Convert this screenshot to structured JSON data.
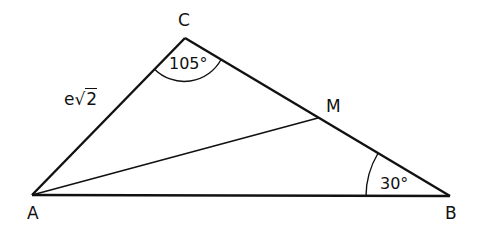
{
  "diagram": {
    "type": "triangle",
    "vertices": {
      "A": {
        "label": "A",
        "x": 32,
        "y": 195
      },
      "B": {
        "label": "B",
        "x": 450,
        "y": 196
      },
      "C": {
        "label": "C",
        "x": 185,
        "y": 38
      },
      "M": {
        "label": "M",
        "x": 318,
        "y": 118
      }
    },
    "segments": [
      "AB",
      "BC",
      "CA",
      "AM"
    ],
    "side_labels": {
      "AC": {
        "prefix": "e",
        "radical": "√",
        "radicand": "2"
      }
    },
    "angles": {
      "C": {
        "label": "105°",
        "vertex": "C"
      },
      "B": {
        "label": "30°",
        "vertex": "B"
      }
    },
    "stroke_color": "#111111",
    "background_color": "#ffffff"
  }
}
